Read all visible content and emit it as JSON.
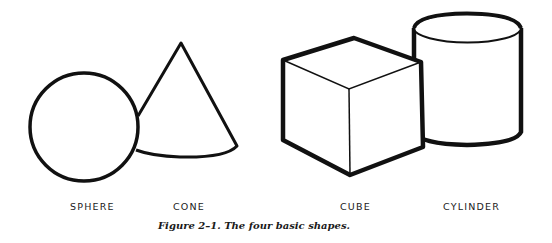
{
  "figure": {
    "caption": "Figure 2–1.   The four basic shapes.",
    "shapes": [
      {
        "name": "sphere",
        "label": "SPHERE"
      },
      {
        "name": "cone",
        "label": "CONE"
      },
      {
        "name": "cube",
        "label": "CUBE"
      },
      {
        "name": "cylinder",
        "label": "CYLINDER"
      }
    ]
  },
  "colors": {
    "stroke": "#111111",
    "background": "#ffffff"
  }
}
